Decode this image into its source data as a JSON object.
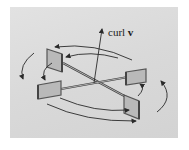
{
  "diagram": {
    "label_prefix": "curl ",
    "label_vector": "v",
    "colors": {
      "background": "#dcdcdc",
      "vane_fill": "#b9b9b9",
      "vane_edge": "#555555",
      "stroke": "#2a2a2a"
    },
    "elements": [
      "curl-v-axis-arrow",
      "paddle-wheel-4-vanes",
      "rotation-arrows"
    ]
  }
}
